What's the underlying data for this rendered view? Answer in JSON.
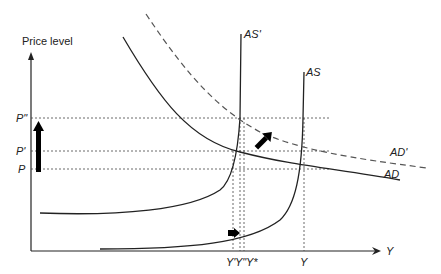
{
  "diagram": {
    "y_axis_title": "Price level",
    "x_axis_label": "Y",
    "price_labels": {
      "p_double": "P\"",
      "p_prime": "P'",
      "p": "P"
    },
    "output_labels": {
      "y_prime": "Y'",
      "y_double": "Y\"",
      "y_star": "Y*",
      "y_full": "Y"
    },
    "curve_labels": {
      "as_prime": "AS'",
      "as": "AS",
      "ad_prime": "AD'",
      "ad": "AD"
    },
    "colors": {
      "line": "#222222",
      "dashed": "#555555",
      "grid": "#444444",
      "arrow": "#000000"
    }
  }
}
